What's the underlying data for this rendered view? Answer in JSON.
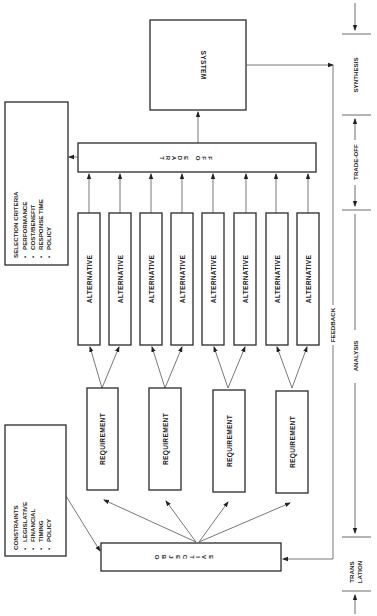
{
  "diagram": {
    "orientation": "rotated-90-ccw",
    "system": {
      "label": "SYSTEM"
    },
    "trade_off": {
      "letters": [
        "T",
        "R",
        "A",
        "D",
        "E",
        "O",
        "F",
        "F"
      ]
    },
    "alternatives": [
      {
        "label": "ALTERNATIVE"
      },
      {
        "label": "ALTERNATIVE"
      },
      {
        "label": "ALTERNATIVE"
      },
      {
        "label": "ALTERNATIVE"
      },
      {
        "label": "ALTERNATIVE"
      },
      {
        "label": "ALTERNATIVE"
      },
      {
        "label": "ALTERNATIVE"
      },
      {
        "label": "ALTERNATIVE"
      }
    ],
    "requirements": [
      {
        "label": "REQUIREMENT"
      },
      {
        "label": "REQUIREMENT"
      },
      {
        "label": "REQUIREMENT"
      },
      {
        "label": "REQUIREMENT"
      }
    ],
    "objective": {
      "letters": [
        "O",
        "B",
        "J",
        "E",
        "C",
        "T",
        "I",
        "V",
        "E"
      ]
    },
    "selection_criteria": {
      "title": "SELECTION CRITERIA",
      "items": [
        "PERFORMANCE",
        "COST/BENEFIT",
        "RESPONSE TIME",
        "POLICY"
      ]
    },
    "constraints": {
      "title": "CONSTRAINTS",
      "items": [
        "LEGISLATIVE",
        "FINANCIAL",
        "TIMING",
        "POLICY"
      ]
    },
    "feedback": {
      "label": "FEEDBACK"
    },
    "phases": [
      {
        "label": "SYNTHESIS"
      },
      {
        "label": "TRADE-OFF"
      },
      {
        "label": "ANALYSIS"
      },
      {
        "label_line1": "TRANS",
        "label_line2": "LATION"
      }
    ],
    "bullet": "•"
  }
}
